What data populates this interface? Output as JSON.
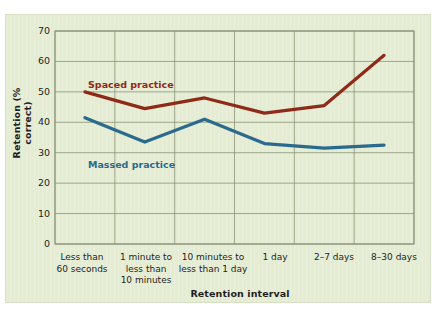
{
  "chart_data": {
    "type": "line",
    "title": "",
    "xlabel": "Retention interval",
    "ylabel": "Retention (% correct)",
    "categories": [
      "Less than\n60 seconds",
      "1 minute to\nless than\n10 minutes",
      "10 minutes to\nless than 1 day",
      "1 day",
      "2–7 days",
      "8–30 days"
    ],
    "ylim": [
      0,
      70
    ],
    "yticks": [
      0,
      10,
      20,
      30,
      40,
      50,
      60,
      70
    ],
    "grid": true,
    "legend_position": "inline-annotations",
    "series": [
      {
        "name": "Spaced practice",
        "color": "#8f2a18",
        "values": [
          50,
          44.5,
          48,
          43,
          45.5,
          62
        ]
      },
      {
        "name": "Massed practice",
        "color": "#2a6a8c",
        "values": [
          41.5,
          33.5,
          41,
          33,
          31.5,
          32.5
        ]
      }
    ]
  },
  "figure": {
    "background_color": "#e4ecd2",
    "grid_color": "#8a9478",
    "text_color": "#1f1f1f"
  }
}
